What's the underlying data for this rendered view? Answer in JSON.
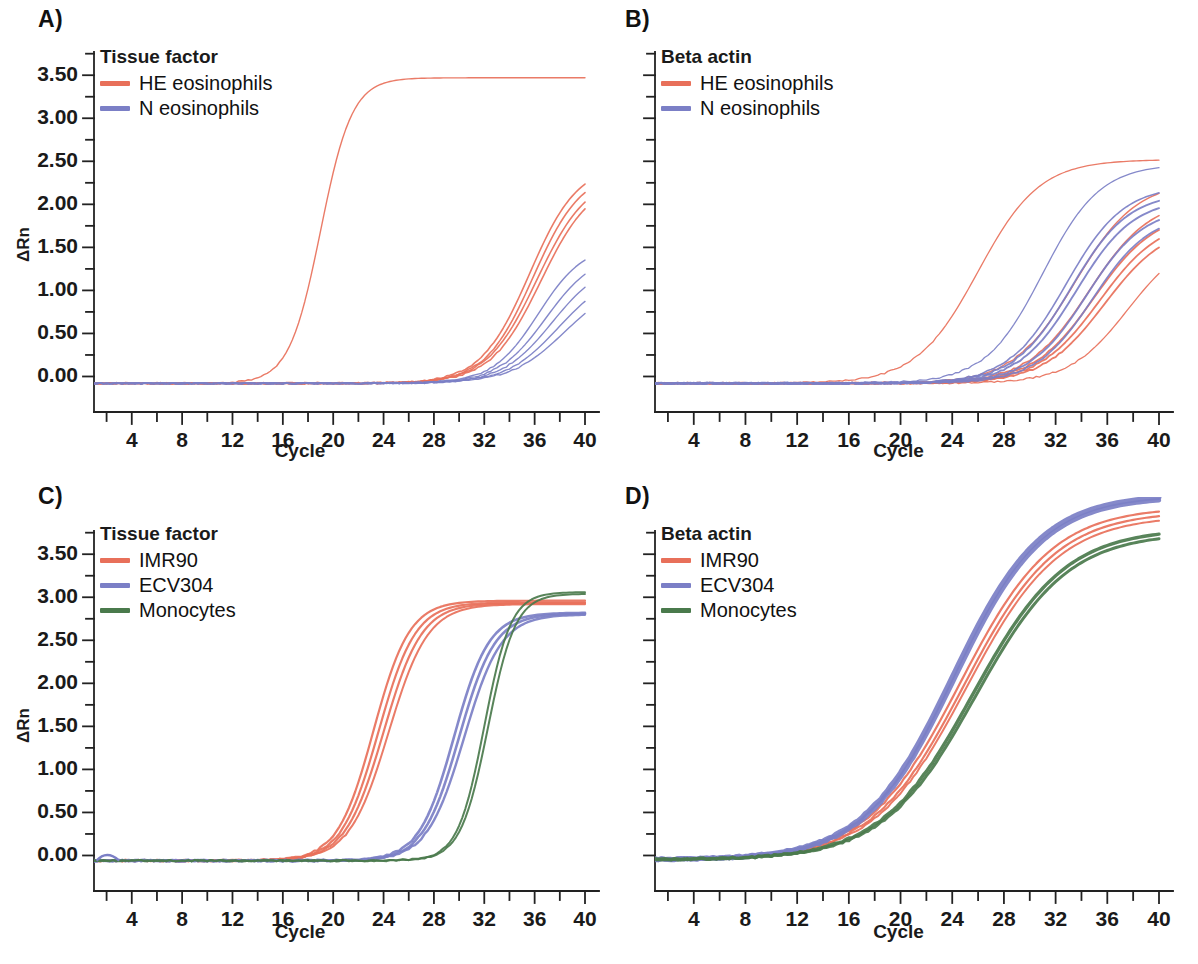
{
  "figure": {
    "panels": [
      {
        "id": "A",
        "label": "A)",
        "legend_title": "Tissue factor",
        "show_y_labels": true,
        "show_y_axis_title": true,
        "y_axis_title": "ΔRn",
        "x_axis_title": "Cycle",
        "series": [
          {
            "name": "HE eosinophils",
            "color": "#E8705A"
          },
          {
            "name": "N eosinophils",
            "color": "#7B7FC6"
          }
        ]
      },
      {
        "id": "B",
        "label": "B)",
        "legend_title": "Beta actin",
        "show_y_labels": false,
        "show_y_axis_title": false,
        "y_axis_title": "",
        "x_axis_title": "Cycle",
        "series": [
          {
            "name": "HE eosinophils",
            "color": "#E8705A"
          },
          {
            "name": "N eosinophils",
            "color": "#7B7FC6"
          }
        ]
      },
      {
        "id": "C",
        "label": "C)",
        "legend_title": "Tissue factor",
        "show_y_labels": true,
        "show_y_axis_title": true,
        "y_axis_title": "ΔRn",
        "x_axis_title": "Cycle",
        "series": [
          {
            "name": "IMR90",
            "color": "#E8705A"
          },
          {
            "name": "ECV304",
            "color": "#7B7FC6"
          },
          {
            "name": "Monocytes",
            "color": "#4A7A4C"
          }
        ]
      },
      {
        "id": "D",
        "label": "D)",
        "legend_title": "Beta actin",
        "show_y_labels": false,
        "show_y_axis_title": false,
        "y_axis_title": "",
        "x_axis_title": "Cycle",
        "series": [
          {
            "name": "IMR90",
            "color": "#E8705A"
          },
          {
            "name": "ECV304",
            "color": "#7B7FC6"
          },
          {
            "name": "Monocytes",
            "color": "#4A7A4C"
          }
        ]
      }
    ]
  },
  "chart_data": [
    {
      "panel": "A",
      "type": "line",
      "title": "Tissue factor",
      "xlabel": "Cycle",
      "ylabel": "ΔRn",
      "xlim": [
        1,
        40
      ],
      "ylim": [
        -0.25,
        3.7
      ],
      "xticks": [
        2,
        4,
        6,
        8,
        10,
        12,
        14,
        16,
        18,
        20,
        22,
        24,
        26,
        28,
        30,
        32,
        34,
        36,
        38,
        40
      ],
      "xtick_labels": [
        "4",
        "8",
        "12",
        "16",
        "20",
        "24",
        "28",
        "32",
        "36",
        "40"
      ],
      "yticks": [
        0.0,
        0.5,
        1.0,
        1.5,
        2.0,
        2.5,
        3.0,
        3.5
      ],
      "ytick_labels": [
        "0.00",
        "0.50",
        "1.00",
        "1.50",
        "2.00",
        "2.50",
        "3.00",
        "3.50"
      ],
      "y_minor_step": 0.25,
      "grid": false,
      "legend_position": "top-left",
      "baseline": -0.08,
      "series": [
        {
          "name": "HE eosinophils",
          "color": "#E8705A",
          "curves": [
            {
              "ct": 19.0,
              "plateau": 3.55,
              "slope": 0.8,
              "width": 1.4
            },
            {
              "ct": 35.6,
              "plateau": 2.55,
              "slope": 0.52,
              "width": 1.6
            },
            {
              "ct": 35.9,
              "plateau": 2.48,
              "slope": 0.52,
              "width": 1.6
            },
            {
              "ct": 36.2,
              "plateau": 2.42,
              "slope": 0.5,
              "width": 1.6
            },
            {
              "ct": 36.5,
              "plateau": 2.38,
              "slope": 0.5,
              "width": 1.6
            }
          ]
        },
        {
          "name": "N eosinophils",
          "color": "#7B7FC6",
          "curves": [
            {
              "ct": 36.3,
              "plateau": 1.62,
              "slope": 0.55,
              "width": 1.4
            },
            {
              "ct": 36.9,
              "plateau": 1.52,
              "slope": 0.52,
              "width": 1.4
            },
            {
              "ct": 37.4,
              "plateau": 1.42,
              "slope": 0.5,
              "width": 1.4
            },
            {
              "ct": 37.9,
              "plateau": 1.3,
              "slope": 0.48,
              "width": 1.4
            },
            {
              "ct": 38.4,
              "plateau": 1.2,
              "slope": 0.46,
              "width": 1.4
            }
          ]
        }
      ]
    },
    {
      "panel": "B",
      "type": "line",
      "title": "Beta actin",
      "xlabel": "Cycle",
      "ylabel": "",
      "xlim": [
        1,
        40
      ],
      "ylim": [
        -0.25,
        3.7
      ],
      "xticks": [
        2,
        4,
        6,
        8,
        10,
        12,
        14,
        16,
        18,
        20,
        22,
        24,
        26,
        28,
        30,
        32,
        34,
        36,
        38,
        40
      ],
      "xtick_labels": [
        "4",
        "8",
        "12",
        "16",
        "20",
        "24",
        "28",
        "32",
        "36",
        "40"
      ],
      "yticks": [
        0.0,
        0.5,
        1.0,
        1.5,
        2.0,
        2.5,
        3.0,
        3.5
      ],
      "ytick_labels": [],
      "y_minor_step": 0.25,
      "grid": false,
      "legend_position": "top-left",
      "baseline": -0.08,
      "series": [
        {
          "name": "HE eosinophils",
          "color": "#E8705A",
          "curves": [
            {
              "ct": 26.0,
              "plateau": 2.6,
              "slope": 0.42,
              "width": 1.3
            },
            {
              "ct": 33.5,
              "plateau": 2.35,
              "slope": 0.42,
              "width": 1.4
            },
            {
              "ct": 34.6,
              "plateau": 2.15,
              "slope": 0.42,
              "width": 1.6
            },
            {
              "ct": 35.0,
              "plateau": 2.0,
              "slope": 0.42,
              "width": 1.8
            },
            {
              "ct": 35.4,
              "plateau": 1.92,
              "slope": 0.42,
              "width": 1.8
            },
            {
              "ct": 35.8,
              "plateau": 1.85,
              "slope": 0.42,
              "width": 1.8
            },
            {
              "ct": 37.6,
              "plateau": 1.72,
              "slope": 0.44,
              "width": 1.3
            }
          ]
        },
        {
          "name": "N eosinophils",
          "color": "#7B7FC6",
          "curves": [
            {
              "ct": 31.0,
              "plateau": 2.55,
              "slope": 0.45,
              "width": 1.3
            },
            {
              "ct": 32.8,
              "plateau": 2.3,
              "slope": 0.45,
              "width": 1.6
            },
            {
              "ct": 33.2,
              "plateau": 2.22,
              "slope": 0.45,
              "width": 1.9
            },
            {
              "ct": 33.6,
              "plateau": 2.15,
              "slope": 0.45,
              "width": 1.9
            },
            {
              "ct": 34.4,
              "plateau": 2.05,
              "slope": 0.45,
              "width": 1.9
            },
            {
              "ct": 34.9,
              "plateau": 1.98,
              "slope": 0.45,
              "width": 1.7
            }
          ]
        }
      ]
    },
    {
      "panel": "C",
      "type": "line",
      "title": "Tissue factor",
      "xlabel": "Cycle",
      "ylabel": "ΔRn",
      "xlim": [
        1,
        40
      ],
      "ylim": [
        -0.25,
        3.7
      ],
      "xticks": [
        2,
        4,
        6,
        8,
        10,
        12,
        14,
        16,
        18,
        20,
        22,
        24,
        26,
        28,
        30,
        32,
        34,
        36,
        38,
        40
      ],
      "xtick_labels": [
        "4",
        "8",
        "12",
        "16",
        "20",
        "24",
        "28",
        "32",
        "36",
        "40"
      ],
      "yticks": [
        0.0,
        0.5,
        1.0,
        1.5,
        2.0,
        2.5,
        3.0,
        3.5
      ],
      "ytick_labels": [
        "0.00",
        "0.50",
        "1.00",
        "1.50",
        "2.00",
        "2.50",
        "3.00",
        "3.50"
      ],
      "y_minor_step": 0.25,
      "grid": false,
      "legend_position": "top-left",
      "baseline": -0.06,
      "series": [
        {
          "name": "IMR90",
          "color": "#E8705A",
          "curves": [
            {
              "ct": 23.2,
              "plateau": 3.02,
              "slope": 0.7,
              "width": 2.2
            },
            {
              "ct": 23.6,
              "plateau": 3.0,
              "slope": 0.68,
              "width": 2.2
            },
            {
              "ct": 24.0,
              "plateau": 2.99,
              "slope": 0.66,
              "width": 2.2
            },
            {
              "ct": 24.4,
              "plateau": 2.98,
              "slope": 0.64,
              "width": 2.0
            }
          ]
        },
        {
          "name": "ECV304",
          "color": "#7B7FC6",
          "curves": [
            {
              "ct": 29.6,
              "plateau": 2.88,
              "slope": 0.72,
              "width": 2.6
            },
            {
              "ct": 30.0,
              "plateau": 2.87,
              "slope": 0.7,
              "width": 2.6
            },
            {
              "ct": 30.4,
              "plateau": 2.86,
              "slope": 0.68,
              "width": 2.4
            }
          ]
        },
        {
          "name": "Monocytes",
          "color": "#4A7A4C",
          "curves": [
            {
              "ct": 32.0,
              "plateau": 3.12,
              "slope": 0.95,
              "width": 2.0
            },
            {
              "ct": 32.3,
              "plateau": 3.1,
              "slope": 0.92,
              "width": 2.0
            }
          ]
        }
      ]
    },
    {
      "panel": "D",
      "type": "line",
      "title": "Beta actin",
      "xlabel": "Cycle",
      "ylabel": "",
      "xlim": [
        1,
        40
      ],
      "ylim": [
        -0.25,
        3.7
      ],
      "xticks": [
        2,
        4,
        6,
        8,
        10,
        12,
        14,
        16,
        18,
        20,
        22,
        24,
        26,
        28,
        30,
        32,
        34,
        36,
        38,
        40
      ],
      "xtick_labels": [
        "4",
        "8",
        "12",
        "16",
        "20",
        "24",
        "28",
        "32",
        "36",
        "40"
      ],
      "yticks": [
        0.0,
        0.5,
        1.0,
        1.5,
        2.0,
        2.5,
        3.0,
        3.5
      ],
      "ytick_labels": [],
      "y_minor_step": 0.25,
      "grid": false,
      "legend_position": "top-left",
      "baseline": -0.05,
      "series": [
        {
          "name": "IMR90",
          "color": "#E8705A",
          "curves": [
            {
              "ct": 24.6,
              "plateau": 4.1,
              "slope": 0.28,
              "width": 2.2
            },
            {
              "ct": 24.9,
              "plateau": 4.05,
              "slope": 0.28,
              "width": 2.2
            },
            {
              "ct": 25.1,
              "plateau": 4.0,
              "slope": 0.28,
              "width": 2.0
            }
          ]
        },
        {
          "name": "ECV304",
          "color": "#7B7FC6",
          "curves": [
            {
              "ct": 24.0,
              "plateau": 4.25,
              "slope": 0.29,
              "width": 5.0
            },
            {
              "ct": 24.2,
              "plateau": 4.22,
              "slope": 0.29,
              "width": 4.4
            }
          ]
        },
        {
          "name": "Monocytes",
          "color": "#4A7A4C",
          "curves": [
            {
              "ct": 25.6,
              "plateau": 3.85,
              "slope": 0.28,
              "width": 3.4
            },
            {
              "ct": 25.8,
              "plateau": 3.8,
              "slope": 0.28,
              "width": 3.0
            }
          ]
        }
      ]
    }
  ]
}
